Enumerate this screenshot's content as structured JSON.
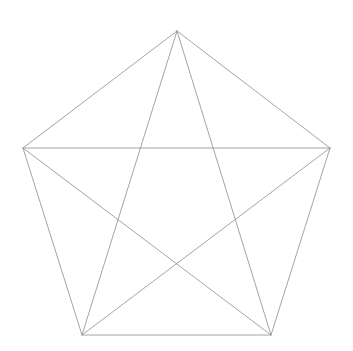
{
  "canvas": {
    "width": 353,
    "height": 351,
    "background_color": "#ffffff",
    "title": "Complete graph K5 drawn as a regular pentagon with all diagonals"
  },
  "style": {
    "edge_color": "#9a9a9a",
    "edge_width": 0.9,
    "vertex_visible": false
  },
  "chart_data": {
    "type": "diagram",
    "subtype": "graph",
    "xlabel": "",
    "ylabel": "",
    "xlim": [
      0,
      353
    ],
    "ylim": [
      0,
      351
    ],
    "grid": false,
    "legend": "none",
    "vertex_count": 5,
    "edge_count": 10,
    "vertices": [
      {
        "id": "top",
        "label": "",
        "x": 177,
        "y": 31
      },
      {
        "id": "right",
        "label": "",
        "x": 330,
        "y": 148
      },
      {
        "id": "bottom-right",
        "label": "",
        "x": 271,
        "y": 335
      },
      {
        "id": "bottom-left",
        "label": "",
        "x": 82,
        "y": 335
      },
      {
        "id": "left",
        "label": "",
        "x": 23,
        "y": 148
      }
    ],
    "edges": [
      {
        "name": "perimeter-top-right",
        "from": "top",
        "to": "right",
        "kind": "side"
      },
      {
        "name": "perimeter-right-bottomright",
        "from": "right",
        "to": "bottom-right",
        "kind": "side"
      },
      {
        "name": "perimeter-bottom",
        "from": "bottom-right",
        "to": "bottom-left",
        "kind": "side"
      },
      {
        "name": "perimeter-bottomleft-left",
        "from": "bottom-left",
        "to": "left",
        "kind": "side"
      },
      {
        "name": "perimeter-left-top",
        "from": "left",
        "to": "top",
        "kind": "side"
      },
      {
        "name": "diagonal-top-bottomleft",
        "from": "top",
        "to": "bottom-left",
        "kind": "diagonal"
      },
      {
        "name": "diagonal-top-bottomright",
        "from": "top",
        "to": "bottom-right",
        "kind": "diagonal"
      },
      {
        "name": "diagonal-left-right",
        "from": "left",
        "to": "right",
        "kind": "diagonal"
      },
      {
        "name": "diagonal-left-bottomright",
        "from": "left",
        "to": "bottom-right",
        "kind": "diagonal"
      },
      {
        "name": "diagonal-right-bottomleft",
        "from": "right",
        "to": "bottom-left",
        "kind": "diagonal"
      }
    ]
  }
}
